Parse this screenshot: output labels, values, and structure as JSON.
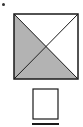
{
  "diagram": {
    "title": "",
    "main_square": {
      "divided_by": "diagonals",
      "shaded_regions": [
        "left-triangle",
        "bottom-triangle"
      ],
      "unshaded_regions": [
        "top-triangle",
        "right-triangle"
      ],
      "shade_color": "#b3b3b3",
      "line_color": "#1a1a1a"
    },
    "answer_square": {
      "shaded_regions": [],
      "underline": true
    },
    "bullet": true
  }
}
